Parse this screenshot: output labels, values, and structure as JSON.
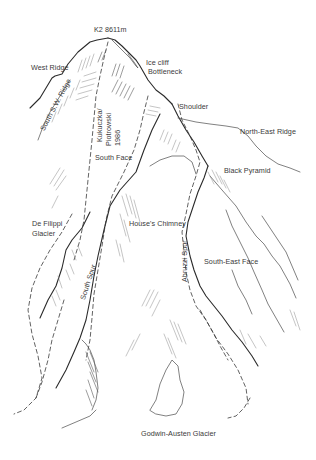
{
  "diagram": {
    "labels": {
      "summit": "K2 8611m",
      "west_ridge": "West Ridge",
      "ice_cliff": "Ice cliff",
      "bottleneck": "Bottleneck",
      "south_sw_ridge": "South S.W. Ridge",
      "shoulder": "Shoulder",
      "kukuczka_line1": "Kukuczka/",
      "kukuczka_line2": "Piotrowski",
      "kukuczka_line3": "1986",
      "north_east_ridge": "North-East Ridge",
      "south_face": "South Face",
      "black_pyramid": "Black Pyramid",
      "de_filippi_line1": "De Filippi",
      "de_filippi_line2": "Glacier",
      "houses_chimney": "House's Chimney",
      "south_east_face": "South-East Face",
      "abruzzi_spur": "Abruzzi Spur",
      "south_spur": "South Spur",
      "godwin_austen": "Godwin-Austen Glacier"
    },
    "colors": {
      "ink": "#2a2a2a",
      "text": "#3a3a3a",
      "hatch": "#8a8a8a",
      "background": "#ffffff"
    }
  }
}
